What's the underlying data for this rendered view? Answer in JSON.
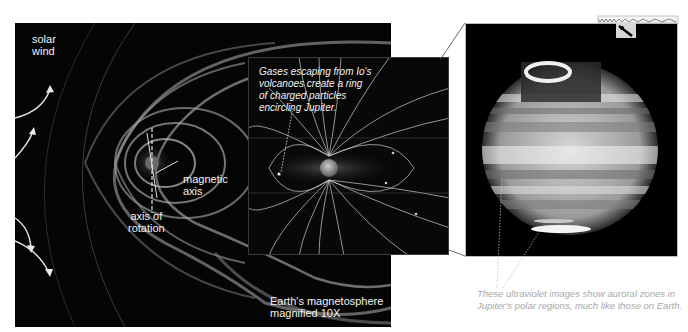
{
  "left_panel": {
    "title": "Jupiter's magnetosphere",
    "labels": {
      "solar_wind_line1": "solar",
      "solar_wind_line2": "wind",
      "magnetic_axis_line1": "magnetic",
      "magnetic_axis_line2": "axis",
      "rotation_axis_line1": "axis of",
      "rotation_axis_line2": "rotation",
      "earth_caption_line1": "Earth's magnetosphere",
      "earth_caption_line2": "magnified 10X"
    }
  },
  "inset_panel": {
    "caption_lines": [
      "Gases escaping from Io's",
      "volcanoes create a ring",
      "of charged particles",
      "encircling Jupiter."
    ]
  },
  "right_panel": {
    "spectrum": {
      "uv_label": "UV",
      "vis_label": "VIS"
    },
    "caption_lines": [
      "These ultraviolet images show auroral zones in",
      "Jupiter's polar regions, much like those on Earth."
    ]
  },
  "colors": {
    "background": "#ffffff",
    "panel": "#050505",
    "field_lines": "#cfcfcf",
    "caption_gray": "#a8a8a8"
  }
}
